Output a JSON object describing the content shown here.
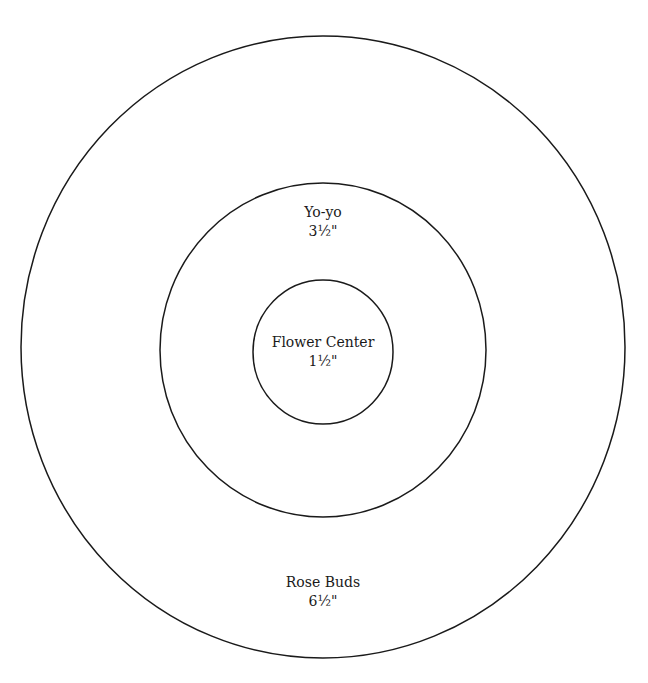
{
  "diagram": {
    "stroke_color": "#1a1a1a",
    "background": "#ffffff",
    "circles": [
      {
        "id": "rose-buds",
        "name": "Rose Buds",
        "size": "6½\"",
        "cx": 323,
        "cy": 347,
        "rx": 302,
        "ry": 311
      },
      {
        "id": "yo-yo",
        "name": "Yo-yo",
        "size": "3½\"",
        "cx": 323,
        "cy": 350,
        "rx": 163,
        "ry": 167
      },
      {
        "id": "flower-center",
        "name": "Flower Center",
        "size": "1½\"",
        "cx": 323,
        "cy": 352,
        "rx": 70,
        "ry": 72
      }
    ]
  },
  "labels": {
    "yoyo": {
      "name": "Yo-yo",
      "size": "3½\""
    },
    "flower_center": {
      "name": "Flower Center",
      "size": "1½\""
    },
    "rose_buds": {
      "name": "Rose Buds",
      "size": "6½\""
    }
  }
}
